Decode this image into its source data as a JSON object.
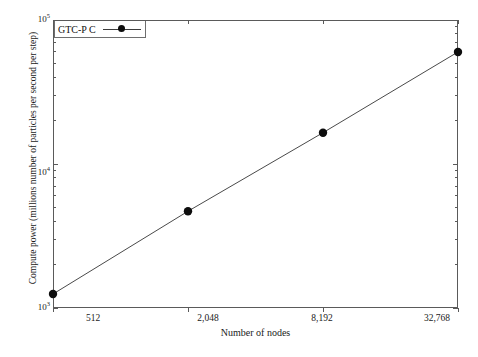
{
  "chart_data": {
    "type": "line",
    "title": "",
    "subtitle": "",
    "xlabel": "Number of nodes",
    "ylabel": "Compute power (millions number of particles per second per step)",
    "xscale": "log2",
    "yscale": "log10",
    "xlim": [
      512,
      32768
    ],
    "ylim": [
      1000,
      100000
    ],
    "grid": false,
    "legend_position": "top-left",
    "x": [
      512,
      2048,
      8192,
      32768
    ],
    "xtick_labels": [
      "512",
      "2,048",
      "8,192",
      "32,768"
    ],
    "ytick_labels": [
      "10³",
      "10⁴",
      "10⁵"
    ],
    "ytick_values": [
      1000,
      10000,
      100000
    ],
    "ytick_mantissas": [
      "10",
      "10",
      "10"
    ],
    "ytick_exponents": [
      "3",
      "4",
      "5"
    ],
    "series": [
      {
        "name": "GTC-P C",
        "marker": "circle",
        "color": "#0d0d0d",
        "line_color": "#4a4a4a",
        "values": [
          1250,
          4700,
          16500,
          60000
        ]
      }
    ],
    "legend": [
      "GTC-P C"
    ]
  },
  "axes": {
    "xlabel": "Number of nodes",
    "ylabel": "Compute power (millions number of particles per second per step)"
  },
  "legend": {
    "entries": [
      {
        "label": "GTC-P C",
        "marker": "circle-marker",
        "line": "solid-line"
      }
    ]
  },
  "colors": {
    "frame": "#5a5a5a",
    "marker": "#0d0d0d",
    "line": "#4a4a4a",
    "text": "#1a1a1a",
    "background": "#ffffff"
  }
}
